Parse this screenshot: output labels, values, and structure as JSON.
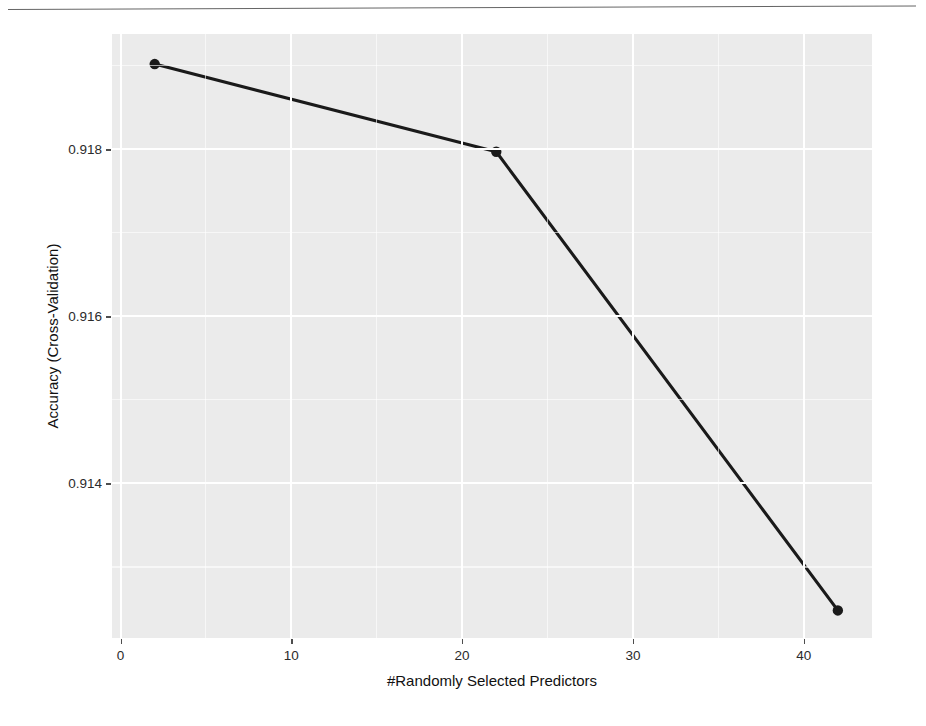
{
  "figure": {
    "page_rule": "horizontal-separator"
  },
  "chart_data": {
    "type": "line",
    "title": "",
    "xlabel": "#Randomly Selected Predictors",
    "ylabel": "Accuracy (Cross-Validation)",
    "x": [
      2,
      22,
      42
    ],
    "values": [
      0.91902,
      0.91797,
      0.91248
    ],
    "series": [
      {
        "name": "Accuracy (Cross-Validation)",
        "x": [
          2,
          22,
          42
        ],
        "values": [
          0.91902,
          0.91797,
          0.91248
        ]
      }
    ],
    "xlim": [
      -0.5,
      44.0
    ],
    "ylim": [
      0.91215,
      0.91938
    ],
    "x_ticks": [
      0,
      10,
      20,
      30,
      40
    ],
    "x_tick_labels": [
      "0",
      "10",
      "20",
      "30",
      "40"
    ],
    "x_minor_ticks": [
      5,
      15,
      25,
      35
    ],
    "y_ticks": [
      0.914,
      0.916,
      0.918
    ],
    "y_tick_labels": [
      "0.914",
      "0.916",
      "0.918"
    ],
    "y_minor_ticks": [
      0.913,
      0.915,
      0.917,
      0.919
    ],
    "grid": true,
    "legend": "none",
    "marker": "filled-circle",
    "line_color": "#1a1a1a",
    "marker_color": "#1a1a1a",
    "panel_color": "#ebebeb",
    "grid_color": "#ffffff",
    "annotations": []
  }
}
